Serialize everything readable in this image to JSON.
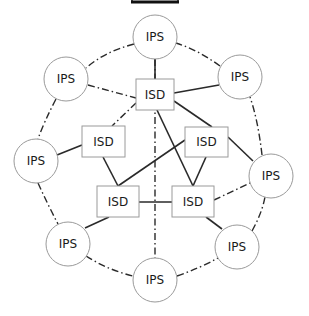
{
  "diagram": {
    "title_bar": {
      "present": true
    },
    "labels": {
      "ips": "IPS",
      "isd": "ISD"
    },
    "ips_nodes": [
      {
        "id": "ips-top",
        "label": "IPS",
        "cx": 155,
        "cy": 37
      },
      {
        "id": "ips-upper-left",
        "label": "IPS",
        "cx": 66,
        "cy": 79
      },
      {
        "id": "ips-upper-right",
        "label": "IPS",
        "cx": 240,
        "cy": 77
      },
      {
        "id": "ips-left",
        "label": "IPS",
        "cx": 36,
        "cy": 161
      },
      {
        "id": "ips-right",
        "label": "IPS",
        "cx": 271,
        "cy": 176
      },
      {
        "id": "ips-lower-left",
        "label": "IPS",
        "cx": 68,
        "cy": 244
      },
      {
        "id": "ips-lower-right",
        "label": "IPS",
        "cx": 237,
        "cy": 247
      },
      {
        "id": "ips-bottom",
        "label": "IPS",
        "cx": 155,
        "cy": 280
      }
    ],
    "isd_nodes": [
      {
        "id": "isd-top",
        "label": "ISD",
        "x": 136,
        "y": 79,
        "w": 38,
        "h": 31
      },
      {
        "id": "isd-left",
        "label": "ISD",
        "x": 82,
        "y": 126,
        "w": 43,
        "h": 31
      },
      {
        "id": "isd-right",
        "label": "ISD",
        "x": 185,
        "y": 127,
        "w": 43,
        "h": 30
      },
      {
        "id": "isd-bottom-left",
        "label": "ISD",
        "x": 97,
        "y": 186,
        "w": 42,
        "h": 31
      },
      {
        "id": "isd-bottom-right",
        "label": "ISD",
        "x": 172,
        "y": 186,
        "w": 42,
        "h": 31
      }
    ],
    "ring_links_dashdot": [
      [
        "ips-top",
        "ips-upper-left"
      ],
      [
        "ips-upper-left",
        "ips-left"
      ],
      [
        "ips-left",
        "ips-lower-left"
      ],
      [
        "ips-lower-left",
        "ips-bottom"
      ],
      [
        "ips-bottom",
        "ips-lower-right"
      ],
      [
        "ips-lower-right",
        "ips-right"
      ],
      [
        "ips-right",
        "ips-upper-right"
      ],
      [
        "ips-upper-right",
        "ips-top"
      ]
    ],
    "inner_links_dashdot": [
      [
        "ips-upper-left",
        "isd-top"
      ],
      [
        "isd-top",
        "isd-left"
      ],
      [
        "ips-top",
        "ips-bottom"
      ],
      [
        "isd-bottom-right",
        "ips-right"
      ]
    ],
    "links_solid": [
      [
        "ips-top",
        "isd-top"
      ],
      [
        "isd-top",
        "ips-upper-right"
      ],
      [
        "isd-top",
        "isd-right"
      ],
      [
        "isd-top",
        "isd-bottom-right"
      ],
      [
        "isd-left",
        "ips-left"
      ],
      [
        "isd-left",
        "isd-bottom-left"
      ],
      [
        "isd-right",
        "isd-bottom-left"
      ],
      [
        "isd-right",
        "isd-bottom-right"
      ],
      [
        "isd-right",
        "ips-right"
      ],
      [
        "isd-bottom-left",
        "isd-bottom-right"
      ],
      [
        "isd-bottom-left",
        "ips-lower-left"
      ],
      [
        "isd-bottom-right",
        "ips-lower-right"
      ]
    ]
  }
}
